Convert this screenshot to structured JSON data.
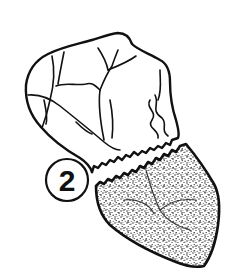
{
  "figure": {
    "type": "anatomical line illustration",
    "label": {
      "number": "2",
      "shape": "circle"
    },
    "colors": {
      "background": "#ffffff",
      "ink": "#111111",
      "stipple": "#1a1a1a"
    },
    "parts": [
      {
        "name": "upper-section",
        "style": "outline with vessels"
      },
      {
        "name": "lower-section",
        "style": "stippled shading"
      }
    ]
  }
}
